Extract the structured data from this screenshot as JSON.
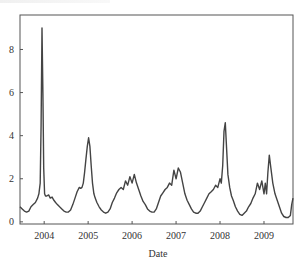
{
  "chart_data": {
    "type": "line",
    "title": "",
    "xlabel": "Date",
    "ylabel": "",
    "xlim": [
      2003.45,
      2009.66
    ],
    "ylim": [
      -0.1,
      9.6
    ],
    "grid": false,
    "legend": null,
    "x_ticks": [
      {
        "value": 2004,
        "label": "2004"
      },
      {
        "value": 2005,
        "label": "2005"
      },
      {
        "value": 2006,
        "label": "2006"
      },
      {
        "value": 2007,
        "label": "2007"
      },
      {
        "value": 2008,
        "label": "2008"
      },
      {
        "value": 2009,
        "label": "2009"
      }
    ],
    "y_ticks": [
      {
        "value": 0,
        "label": "0"
      },
      {
        "value": 2,
        "label": "2"
      },
      {
        "value": 4,
        "label": "4"
      },
      {
        "value": 6,
        "label": "6"
      },
      {
        "value": 8,
        "label": "8"
      }
    ],
    "series": [
      {
        "name": "series",
        "color": "#444444",
        "x": [
          2003.45,
          2003.5,
          2003.55,
          2003.6,
          2003.65,
          2003.7,
          2003.75,
          2003.8,
          2003.85,
          2003.88,
          2003.91,
          2003.93,
          2003.95,
          2003.97,
          2003.99,
          2004.01,
          2004.03,
          2004.06,
          2004.1,
          2004.14,
          2004.18,
          2004.22,
          2004.26,
          2004.3,
          2004.35,
          2004.4,
          2004.45,
          2004.5,
          2004.55,
          2004.6,
          2004.65,
          2004.7,
          2004.75,
          2004.8,
          2004.83,
          2004.86,
          2004.89,
          2004.92,
          2004.95,
          2004.98,
          2005.01,
          2005.04,
          2005.07,
          2005.1,
          2005.13,
          2005.16,
          2005.2,
          2005.25,
          2005.3,
          2005.35,
          2005.4,
          2005.45,
          2005.5,
          2005.55,
          2005.6,
          2005.65,
          2005.7,
          2005.75,
          2005.8,
          2005.85,
          2005.9,
          2005.95,
          2006.0,
          2006.05,
          2006.1,
          2006.15,
          2006.2,
          2006.25,
          2006.3,
          2006.35,
          2006.4,
          2006.45,
          2006.5,
          2006.55,
          2006.6,
          2006.65,
          2006.7,
          2006.75,
          2006.8,
          2006.85,
          2006.9,
          2006.95,
          2007.0,
          2007.05,
          2007.1,
          2007.15,
          2007.2,
          2007.25,
          2007.3,
          2007.35,
          2007.4,
          2007.45,
          2007.5,
          2007.55,
          2007.6,
          2007.65,
          2007.7,
          2007.75,
          2007.8,
          2007.85,
          2007.9,
          2007.95,
          2008.0,
          2008.03,
          2008.06,
          2008.09,
          2008.12,
          2008.15,
          2008.18,
          2008.22,
          2008.26,
          2008.3,
          2008.35,
          2008.4,
          2008.45,
          2008.5,
          2008.55,
          2008.6,
          2008.65,
          2008.7,
          2008.75,
          2008.8,
          2008.85,
          2008.9,
          2008.95,
          2009.0,
          2009.03,
          2009.06,
          2009.09,
          2009.12,
          2009.15,
          2009.2,
          2009.25,
          2009.3,
          2009.35,
          2009.4,
          2009.45,
          2009.5,
          2009.55,
          2009.6,
          2009.63,
          2009.66
        ],
        "y": [
          0.7,
          0.6,
          0.5,
          0.45,
          0.5,
          0.7,
          0.8,
          0.9,
          1.1,
          1.3,
          1.8,
          4.5,
          9.0,
          6.0,
          2.5,
          1.3,
          1.2,
          1.2,
          1.25,
          1.1,
          1.15,
          1.0,
          0.9,
          0.8,
          0.7,
          0.6,
          0.5,
          0.45,
          0.45,
          0.55,
          0.8,
          1.1,
          1.4,
          1.6,
          1.55,
          1.6,
          1.8,
          2.3,
          2.9,
          3.5,
          3.9,
          3.5,
          2.6,
          1.8,
          1.3,
          1.1,
          0.9,
          0.7,
          0.55,
          0.45,
          0.4,
          0.45,
          0.6,
          0.9,
          1.1,
          1.35,
          1.5,
          1.6,
          1.5,
          1.9,
          1.7,
          2.1,
          1.8,
          2.2,
          1.8,
          1.5,
          1.2,
          0.95,
          0.8,
          0.6,
          0.5,
          0.45,
          0.45,
          0.6,
          0.9,
          1.2,
          1.35,
          1.5,
          1.6,
          1.8,
          1.7,
          2.4,
          2.0,
          2.5,
          2.3,
          1.8,
          1.3,
          1.0,
          0.8,
          0.6,
          0.45,
          0.4,
          0.4,
          0.5,
          0.7,
          0.9,
          1.1,
          1.3,
          1.4,
          1.5,
          1.7,
          1.6,
          2.0,
          1.8,
          2.6,
          4.2,
          4.6,
          3.4,
          2.2,
          1.6,
          1.2,
          1.0,
          0.7,
          0.5,
          0.35,
          0.3,
          0.4,
          0.5,
          0.7,
          0.85,
          1.1,
          1.3,
          1.8,
          1.5,
          1.9,
          1.3,
          1.8,
          1.3,
          2.3,
          3.1,
          2.6,
          1.8,
          1.3,
          1.0,
          0.7,
          0.4,
          0.25,
          0.2,
          0.2,
          0.3,
          0.8,
          1.1
        ]
      }
    ]
  },
  "figure": {
    "frame": {
      "left": 20,
      "top": 15,
      "right": 293,
      "bottom": 224
    },
    "line_color": "#444444",
    "frame_color": "#555555"
  }
}
